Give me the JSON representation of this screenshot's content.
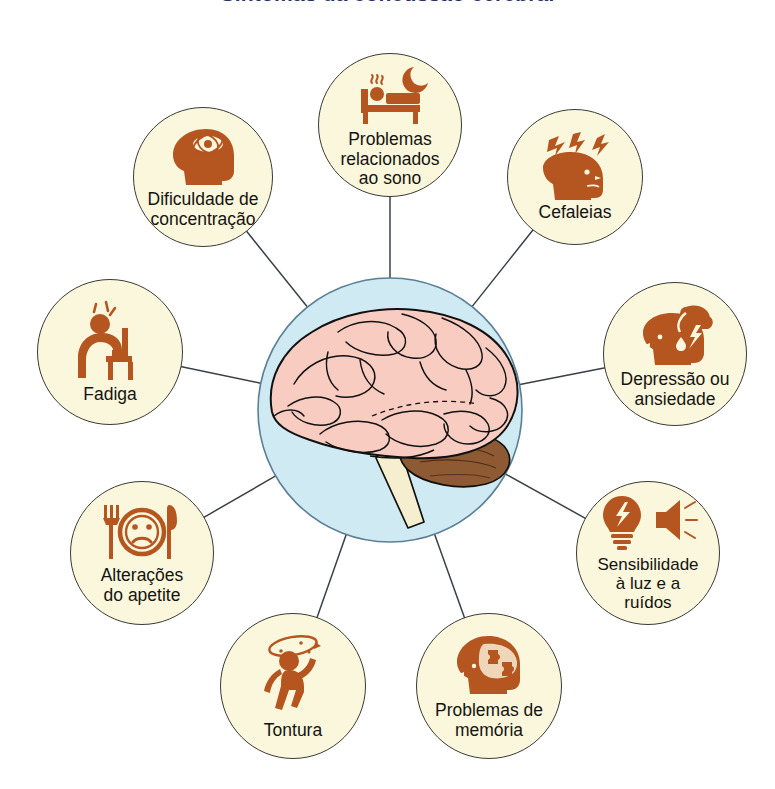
{
  "title": "Sintomas da concussão cerebral",
  "colors": {
    "bubble_fill": "#faf7dd",
    "bubble_border": "#3b3a35",
    "icon": "#b5551f",
    "icon_dark": "#9c4618",
    "center_circle": "#cfeaf3",
    "center_border": "#5b7f96",
    "brain_pink": "#f8ccc0",
    "brain_outline": "#111111",
    "cerebellum": "#8d5a34",
    "brainstem": "#f6efcf",
    "connector": "#3a4048",
    "title_color": "#2b2f63",
    "label_color": "#15130f"
  },
  "center": {
    "name": "brain-illustration",
    "description": "Cérebro humano em vista lateral"
  },
  "bubbles": [
    {
      "id": "sono",
      "label": "Problemas\nrelacionados\nao sono",
      "icon": "bed-moon-icon",
      "cx": 390,
      "cy": 125,
      "r": 72
    },
    {
      "id": "concentracao",
      "label": "Dificuldade de\nconcentração",
      "icon": "head-swirl-icon",
      "cx": 203,
      "cy": 177,
      "r": 70
    },
    {
      "id": "cefaleias",
      "label": "Cefaleias",
      "icon": "head-lightning-icon",
      "cx": 575,
      "cy": 177,
      "r": 68
    },
    {
      "id": "fadiga",
      "label": "Fadiga",
      "icon": "tired-person-chair-icon",
      "cx": 110,
      "cy": 352,
      "r": 73
    },
    {
      "id": "depressao",
      "label": "Depressão ou\nansiedade",
      "icon": "head-storm-cloud-icon",
      "cx": 675,
      "cy": 354,
      "r": 72
    },
    {
      "id": "apetite",
      "label": "Alterações\ndo apetite",
      "icon": "plate-sad-face-icon",
      "cx": 142,
      "cy": 553,
      "r": 72
    },
    {
      "id": "sensibilidade",
      "label": "Sensibilidade\nà luz e a\nruídos",
      "icon": "bulb-speaker-icon",
      "cx": 648,
      "cy": 553,
      "r": 72
    },
    {
      "id": "tontura",
      "label": "Tontura",
      "icon": "dizzy-person-icon",
      "cx": 293,
      "cy": 686,
      "r": 73
    },
    {
      "id": "memoria",
      "label": "Problemas de\nmemória",
      "icon": "head-puzzle-icon",
      "cx": 489,
      "cy": 686,
      "r": 73
    }
  ],
  "layout": {
    "center_x": 390,
    "center_y": 410,
    "center_r": 132,
    "width": 775,
    "height": 789
  }
}
